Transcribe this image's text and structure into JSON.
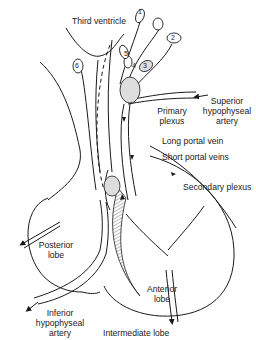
{
  "diagram": {
    "labels": {
      "third_ventricle": "Third ventricle",
      "superior_artery_1": "Superior",
      "superior_artery_2": "hypophyseal",
      "superior_artery_3": "artery",
      "primary_plexus_1": "Primary",
      "primary_plexus_2": "plexus",
      "long_portal_vein": "Long portal vein",
      "short_portal_veins": "Short portal veins",
      "secondary_plexus": "Secondary plexus",
      "posterior_lobe_1": "Posterior",
      "posterior_lobe_2": "lobe",
      "anterior_lobe_1": "Anterior",
      "anterior_lobe_2": "lobe",
      "inferior_artery_1": "Inferior",
      "inferior_artery_2": "hypophyseal",
      "inferior_artery_3": "artery",
      "intermediate_lobe": "Intermediate lobe"
    },
    "neuron_numbers": [
      "1",
      "2",
      "3",
      "4",
      "5",
      "6"
    ],
    "colors": {
      "line": "#1a1a1a",
      "background": "#ffffff",
      "hatch": "#555555"
    }
  }
}
